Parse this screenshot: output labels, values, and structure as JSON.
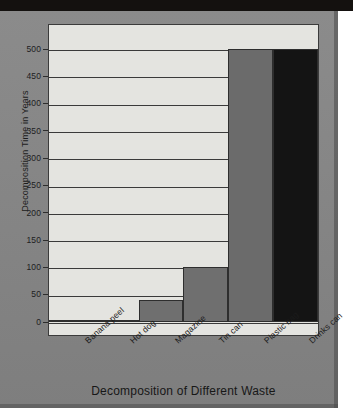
{
  "chart_data": {
    "type": "bar",
    "title": "",
    "xlabel": "Decomposition of Different Waste",
    "ylabel": "Decomposition Time in Years",
    "categories": [
      "Banana peel",
      "Hot dog",
      "Magazine",
      "Tin can",
      "Plastic bag",
      "Drinks can"
    ],
    "values": [
      1,
      2,
      40,
      100,
      500,
      500
    ],
    "ylim": [
      0,
      500
    ],
    "ytick_labels": [
      "0",
      "50",
      "100",
      "150",
      "200",
      "250",
      "300",
      "350",
      "400",
      "450",
      "500"
    ],
    "ytick_values": [
      0,
      50,
      100,
      150,
      200,
      250,
      300,
      350,
      400,
      450,
      500
    ],
    "grid": true,
    "legend": "none",
    "bar_colors": [
      "#1d1d1d",
      "#1d1d1d",
      "#6f6f6f",
      "#6f6f6f",
      "#6b6b6b",
      "#141414"
    ],
    "plot_background": "#e4e4e0",
    "page_background": "#878787"
  },
  "axis": {
    "y_title": "Decomposition Time in Years",
    "x_title": "Decomposition of Different Waste"
  }
}
